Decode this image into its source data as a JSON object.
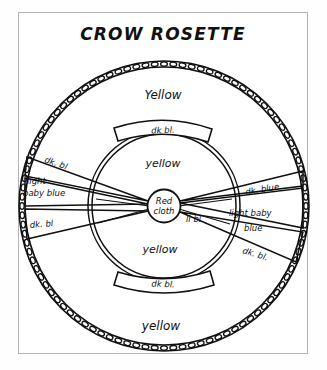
{
  "page": {
    "title": "CROW ROSETTE",
    "background_color": "#ffffff",
    "frame_color": "#b4b4b4",
    "ink_color": "#111111"
  },
  "diagram": {
    "name": "crow-rosette",
    "center": {
      "label_line1": "Red",
      "label_line2": "cloth"
    },
    "outer_ring": {
      "style": "beaded-loop-edge"
    },
    "labels": {
      "outer_top": "Yellow",
      "outer_bottom": "yellow",
      "inner_top": "yellow",
      "inner_bottom": "yellow",
      "band_top": "dk bl.",
      "band_bottom": "dk bl.",
      "left_upper_spoke": "dk. bl",
      "left_middle_spoke_line1": "light",
      "left_middle_spoke_line2": "baby blue",
      "left_lower_spoke": "dk. bl",
      "right_upper_spoke": "dk. blue",
      "right_middle_spoke_line1": "light baby",
      "right_middle_spoke_line2": "blue",
      "right_lower_spoke": "dk. bl.",
      "center_right_small": "li bl"
    }
  }
}
